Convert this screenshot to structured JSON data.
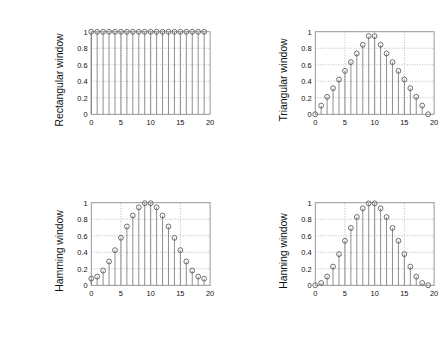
{
  "figure": {
    "layout": "2x2",
    "panels": [
      "rectangular",
      "triangular",
      "hamming",
      "hanning"
    ]
  },
  "chart_data": [
    {
      "type": "scatter",
      "title": "",
      "ylabel": "Rectangular window",
      "xlabel": "",
      "xlim": [
        0,
        20
      ],
      "ylim": [
        0,
        1
      ],
      "xticks": [
        0,
        5,
        10,
        15,
        20
      ],
      "xtick_labels": [
        "0",
        "5",
        "10",
        "15",
        "20"
      ],
      "yticks": [
        0,
        0.2,
        0.4,
        0.6,
        0.8,
        1
      ],
      "ytick_labels": [
        "0",
        "0.2",
        "0.4",
        "0.6",
        "0.8",
        "1"
      ],
      "grid": true,
      "legend": "none",
      "marker": "circle",
      "style": "stem",
      "x": [
        0,
        1,
        2,
        3,
        4,
        5,
        6,
        7,
        8,
        9,
        10,
        11,
        12,
        13,
        14,
        15,
        16,
        17,
        18,
        19
      ],
      "values": [
        1,
        1,
        1,
        1,
        1,
        1,
        1,
        1,
        1,
        1,
        1,
        1,
        1,
        1,
        1,
        1,
        1,
        1,
        1,
        1
      ]
    },
    {
      "type": "scatter",
      "title": "",
      "ylabel": "Triangular window",
      "xlabel": "",
      "xlim": [
        0,
        20
      ],
      "ylim": [
        0,
        1
      ],
      "xticks": [
        0,
        5,
        10,
        15,
        20
      ],
      "xtick_labels": [
        "0",
        "5",
        "10",
        "15",
        "20"
      ],
      "yticks": [
        0,
        0.2,
        0.4,
        0.6,
        0.8,
        1
      ],
      "ytick_labels": [
        "0",
        "0.2",
        "0.4",
        "0.6",
        "0.8",
        "1"
      ],
      "grid": true,
      "legend": "none",
      "marker": "circle",
      "style": "stem",
      "x": [
        0,
        1,
        2,
        3,
        4,
        5,
        6,
        7,
        8,
        9,
        10,
        11,
        12,
        13,
        14,
        15,
        16,
        17,
        18,
        19
      ],
      "values": [
        0,
        0.105,
        0.211,
        0.316,
        0.421,
        0.526,
        0.632,
        0.737,
        0.842,
        0.947,
        0.947,
        0.842,
        0.737,
        0.632,
        0.526,
        0.421,
        0.316,
        0.211,
        0.105,
        0
      ]
    },
    {
      "type": "scatter",
      "title": "",
      "ylabel": "Hamming window",
      "xlabel": "",
      "xlim": [
        0,
        20
      ],
      "ylim": [
        0,
        1
      ],
      "xticks": [
        0,
        5,
        10,
        15,
        20
      ],
      "xtick_labels": [
        "0",
        "5",
        "10",
        "15",
        "20"
      ],
      "yticks": [
        0,
        0.2,
        0.4,
        0.6,
        0.8,
        1
      ],
      "ytick_labels": [
        "0",
        "0.2",
        "0.4",
        "0.6",
        "0.8",
        "1"
      ],
      "grid": true,
      "legend": "none",
      "marker": "circle",
      "style": "stem",
      "x": [
        0,
        1,
        2,
        3,
        4,
        5,
        6,
        7,
        8,
        9,
        10,
        11,
        12,
        13,
        14,
        15,
        16,
        17,
        18,
        19
      ],
      "values": [
        0.08,
        0.105,
        0.178,
        0.288,
        0.425,
        0.575,
        0.712,
        0.845,
        0.945,
        0.995,
        0.995,
        0.945,
        0.845,
        0.712,
        0.575,
        0.425,
        0.288,
        0.178,
        0.105,
        0.08
      ]
    },
    {
      "type": "scatter",
      "title": "",
      "ylabel": "Hanning window",
      "xlabel": "",
      "xlim": [
        0,
        20
      ],
      "ylim": [
        0,
        1
      ],
      "xticks": [
        0,
        5,
        10,
        15,
        20
      ],
      "xtick_labels": [
        "0",
        "5",
        "10",
        "15",
        "20"
      ],
      "yticks": [
        0,
        0.2,
        0.4,
        0.6,
        0.8,
        1
      ],
      "ytick_labels": [
        "0",
        "0.2",
        "0.4",
        "0.6",
        "0.8",
        "1"
      ],
      "grid": true,
      "legend": "none",
      "marker": "circle",
      "style": "stem",
      "x": [
        0,
        1,
        2,
        3,
        4,
        5,
        6,
        7,
        8,
        9,
        10,
        11,
        12,
        13,
        14,
        15,
        16,
        17,
        18,
        19
      ],
      "values": [
        0,
        0.027,
        0.105,
        0.226,
        0.377,
        0.539,
        0.695,
        0.827,
        0.933,
        0.993,
        0.993,
        0.933,
        0.827,
        0.695,
        0.539,
        0.377,
        0.226,
        0.105,
        0.027,
        0
      ]
    }
  ],
  "colors": {
    "stem": "#636363",
    "marker": "#4a4a4a",
    "grid": "#8a8a8a",
    "frame": "#6f6f6f",
    "text": "#111111",
    "background": "#ffffff"
  }
}
